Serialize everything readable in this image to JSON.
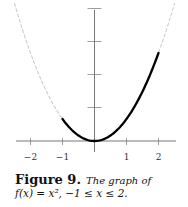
{
  "chart_data": {
    "type": "line",
    "title": "",
    "xlabel": "",
    "ylabel": "",
    "xlim": [
      -2.5,
      2.5
    ],
    "ylim": [
      0,
      6
    ],
    "x_ticks": [
      -2,
      -1,
      1,
      2
    ],
    "x_tick_labels": [
      "−2",
      "−1",
      "1",
      "2"
    ],
    "y_ticks": [
      1.5,
      3,
      4.5,
      6
    ],
    "y_tick_labels": [],
    "grid": false,
    "legend": null,
    "series": [
      {
        "name": "f(x) = x^2 (full, dashed)",
        "style": "dashed",
        "color": "#cccccc",
        "x": [
          -2.5,
          -2,
          -1.5,
          -1,
          -0.5,
          0,
          0.5,
          1,
          1.5,
          2,
          2.5
        ],
        "values": [
          6.25,
          4,
          2.25,
          1,
          0.25,
          0,
          0.25,
          1,
          2.25,
          4,
          6.25
        ]
      },
      {
        "name": "f(x) = x^2, -1 <= x <= 2 (solid)",
        "style": "solid",
        "color": "#000000",
        "x": [
          -1,
          -0.5,
          0,
          0.5,
          1,
          1.5,
          2
        ],
        "values": [
          1,
          0.25,
          0,
          0.25,
          1,
          2.25,
          4
        ]
      }
    ]
  },
  "caption": {
    "label": "Figure 9.",
    "text": "The graph of",
    "math": "f(x) = x², −1 ≤ x ≤ 2."
  }
}
